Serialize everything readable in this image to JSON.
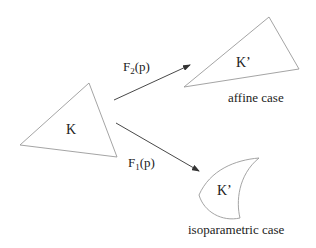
{
  "colors": {
    "shape_stroke": "#9a9a9a",
    "arrow_stroke": "#333333",
    "text": "#222222",
    "background": "#ffffff"
  },
  "reference_element": {
    "label": "K",
    "shape": "triangle"
  },
  "mappings": [
    {
      "name": "F",
      "subscript": "2",
      "argument": "(p)",
      "target_label": "K’",
      "target_shape": "triangle",
      "caption": "affine case"
    },
    {
      "name": "F",
      "subscript": "1",
      "argument": "(p)",
      "target_label": "K’",
      "target_shape": "curved",
      "caption": "isoparametric case"
    }
  ]
}
